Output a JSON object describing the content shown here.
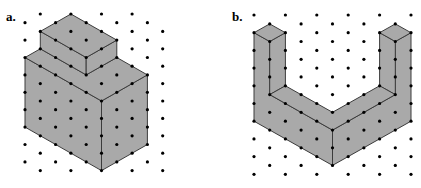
{
  "figure": {
    "colors": {
      "background": "#ffffff",
      "fill": "#a9a9a9",
      "edge": "#3c3c3c",
      "dot": "#000000"
    },
    "panels": [
      {
        "id": "a",
        "label": "a.",
        "label_pos": [
          6,
          10
        ],
        "description": "Two stacked rectangular prisms on isometric dot paper",
        "grid": {
          "origin": [
            25,
            14
          ],
          "dx": 15.3,
          "dy": 8.7,
          "cols": 10,
          "rows": 19,
          "parity": 1,
          "missing": [
            [
              9,
              0
            ]
          ]
        },
        "faces": [
          {
            "name": "lower-box-left-face",
            "points": [
              [
                0,
                5
              ],
              [
                5,
                10
              ],
              [
                5,
                18
              ],
              [
                0,
                13
              ]
            ]
          },
          {
            "name": "lower-box-right-face",
            "points": [
              [
                5,
                10
              ],
              [
                8,
                7
              ],
              [
                8,
                15
              ],
              [
                5,
                18
              ]
            ]
          },
          {
            "name": "lower-box-top-face",
            "points": [
              [
                0,
                5
              ],
              [
                1,
                4
              ],
              [
                4,
                7
              ],
              [
                6,
                5
              ],
              [
                8,
                7
              ],
              [
                5,
                10
              ]
            ]
          },
          {
            "name": "upper-box-left-face",
            "points": [
              [
                1,
                2
              ],
              [
                4,
                5
              ],
              [
                4,
                7
              ],
              [
                1,
                4
              ]
            ]
          },
          {
            "name": "upper-box-right-face",
            "points": [
              [
                4,
                5
              ],
              [
                6,
                3
              ],
              [
                6,
                5
              ],
              [
                4,
                7
              ]
            ]
          },
          {
            "name": "upper-box-top-face",
            "points": [
              [
                3,
                0
              ],
              [
                1,
                2
              ],
              [
                4,
                5
              ],
              [
                6,
                3
              ]
            ]
          }
        ]
      },
      {
        "id": "b",
        "label": "b.",
        "label_pos": [
          232,
          10
        ],
        "description": "U-shaped solid with two pillars joined by a V-shaped base on isometric dot paper",
        "grid": {
          "origin": [
            254,
            15
          ],
          "dx": 15.7,
          "dy": 8.85,
          "cols": 11,
          "rows": 19,
          "parity": 0,
          "missing": []
        },
        "faces": [
          {
            "name": "outer-left-face",
            "points": [
              [
                0,
                2
              ],
              [
                1,
                3
              ],
              [
                1,
                9
              ],
              [
                5,
                13
              ],
              [
                5,
                17
              ],
              [
                0,
                12
              ]
            ]
          },
          {
            "name": "outer-right-face",
            "points": [
              [
                10,
                2
              ],
              [
                9,
                3
              ],
              [
                9,
                9
              ],
              [
                5,
                13
              ],
              [
                5,
                17
              ],
              [
                10,
                12
              ]
            ]
          },
          {
            "name": "left-pillar-inner-face",
            "points": [
              [
                1,
                3
              ],
              [
                2,
                2
              ],
              [
                2,
                8
              ],
              [
                1,
                9
              ]
            ]
          },
          {
            "name": "right-pillar-inner-face",
            "points": [
              [
                8,
                2
              ],
              [
                9,
                3
              ],
              [
                9,
                9
              ],
              [
                8,
                8
              ]
            ]
          },
          {
            "name": "base-top-face",
            "points": [
              [
                1,
                9
              ],
              [
                2,
                8
              ],
              [
                5,
                11
              ],
              [
                8,
                8
              ],
              [
                9,
                9
              ],
              [
                5,
                13
              ]
            ]
          },
          {
            "name": "left-pillar-top-face",
            "points": [
              [
                1,
                1
              ],
              [
                0,
                2
              ],
              [
                1,
                3
              ],
              [
                2,
                2
              ]
            ]
          },
          {
            "name": "right-pillar-top-face",
            "points": [
              [
                9,
                1
              ],
              [
                8,
                2
              ],
              [
                9,
                3
              ],
              [
                10,
                2
              ]
            ]
          }
        ]
      }
    ]
  }
}
